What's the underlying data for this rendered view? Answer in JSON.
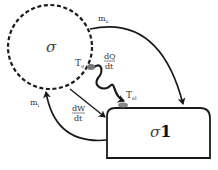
{
  "diagram": {
    "system_label": "σ",
    "subsystem": {
      "sigma": "σ",
      "index": "1"
    },
    "flows": {
      "mass_out": {
        "symbol": "m",
        "subscript": "o"
      },
      "mass_in": {
        "symbol": "m",
        "subscript": "i"
      },
      "heat": {
        "numerator": "dQ",
        "denominator": "dt"
      },
      "work": {
        "numerator": "dW",
        "denominator": "dt"
      }
    },
    "temperatures": {
      "system": {
        "symbol": "T",
        "subscript": "σ"
      },
      "electrode": {
        "symbol": "T",
        "subscript": "el"
      }
    },
    "colors": {
      "stroke": "#1a1a1a",
      "text": "#333333",
      "contact": "#777777"
    }
  }
}
